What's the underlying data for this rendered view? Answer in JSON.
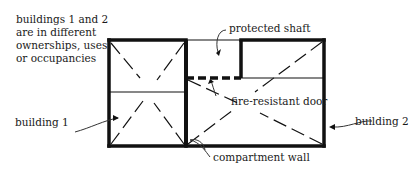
{
  "diagram": {
    "type": "floor-plan",
    "note_lines": [
      "buildings 1 and 2",
      "are in different",
      "ownerships, uses",
      "or occupancies"
    ],
    "labels": {
      "protected_shaft": "protected shaft",
      "fire_resistant_door": "fire-resistant door",
      "building_1": "building 1",
      "building_2": "building 2",
      "compartment_wall": "compartment wall"
    },
    "colors": {
      "line": "#111111",
      "background": "#ffffff"
    }
  }
}
